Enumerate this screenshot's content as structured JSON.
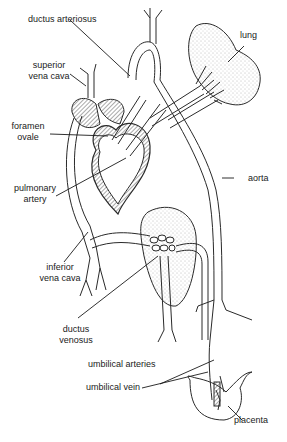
{
  "diagram": {
    "labels": {
      "ductus_arteriosus": "ductus arteriosus",
      "lung": "lung",
      "superior_vena_cava_1": "superior",
      "superior_vena_cava_2": "vena cava",
      "foramen_ovale_1": "foramen",
      "foramen_ovale_2": "ovale",
      "pulmonary_artery_1": "pulmonary",
      "pulmonary_artery_2": "artery",
      "aorta": "aorta",
      "inferior_vena_cava_1": "inferior",
      "inferior_vena_cava_2": "vena cava",
      "ductus_venosus_1": "ductus",
      "ductus_venosus_2": "venosus",
      "umbilical_arteries": "umbilical arteries",
      "umbilical_vein": "umbilical vein",
      "placenta": "placenta"
    },
    "colors": {
      "line": "#2a2a2a",
      "hatch": "#555555",
      "stipple": "#bdbdbd",
      "background": "#ffffff"
    }
  }
}
